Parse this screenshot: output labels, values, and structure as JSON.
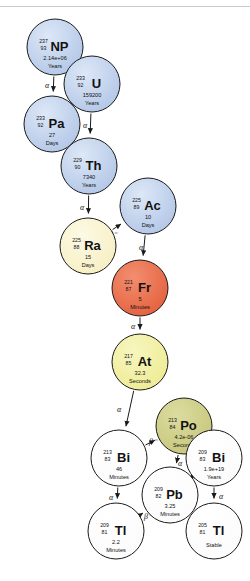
{
  "figure": {
    "caption_truncated": "",
    "colors": {
      "blue": "#b9ccea",
      "cream": "#faf2cd",
      "orange": "#ea6a47",
      "yellow": "#f2f0a2",
      "olive": "#cdcd87",
      "white": "#ffffff",
      "stroke": "#1a1a1a",
      "text": "#111111",
      "divider": "#c9c9d2"
    }
  },
  "nodes": [
    {
      "id": "np237",
      "symbol": "NP",
      "mass": "237",
      "atomic": "93",
      "halflife": "2.14e+06",
      "unit": "Years",
      "fill": "blue",
      "cx": 55,
      "cy": 47,
      "r": 28
    },
    {
      "id": "u233",
      "symbol": "U",
      "mass": "233",
      "atomic": "92",
      "halflife": "159200",
      "unit": "Years",
      "fill": "blue",
      "cx": 92,
      "cy": 84,
      "r": 28
    },
    {
      "id": "pa233",
      "symbol": "Pa",
      "mass": "233",
      "atomic": "92",
      "halflife": "27",
      "unit": "Days",
      "fill": "blue",
      "cx": 52,
      "cy": 124,
      "r": 28
    },
    {
      "id": "th229",
      "symbol": "Th",
      "mass": "229",
      "atomic": "90",
      "halflife": "7340",
      "unit": "Years",
      "fill": "blue",
      "cx": 89,
      "cy": 166,
      "r": 28
    },
    {
      "id": "ac225",
      "symbol": "Ac",
      "mass": "225",
      "atomic": "89",
      "halflife": "10",
      "unit": "Days",
      "fill": "blue",
      "cx": 148,
      "cy": 206,
      "r": 28
    },
    {
      "id": "ra225",
      "symbol": "Ra",
      "mass": "225",
      "atomic": "88",
      "halflife": "15",
      "unit": "Days",
      "fill": "cream",
      "cx": 88,
      "cy": 246,
      "r": 28
    },
    {
      "id": "fr221",
      "symbol": "Fr",
      "mass": "221",
      "atomic": "87",
      "halflife": "5",
      "unit": "Minutes",
      "fill": "orange",
      "cx": 140,
      "cy": 288,
      "r": 28
    },
    {
      "id": "at217",
      "symbol": "At",
      "mass": "217",
      "atomic": "85",
      "halflife": "32.3",
      "unit": "Seconds",
      "fill": "yellow",
      "cx": 140,
      "cy": 362,
      "r": 28
    },
    {
      "id": "po213",
      "symbol": "Po",
      "mass": "213",
      "atomic": "84",
      "halflife": "4.2e-06",
      "unit": "Seconds",
      "fill": "olive",
      "cx": 184,
      "cy": 426,
      "r": 28
    },
    {
      "id": "bi213",
      "symbol": "Bi",
      "mass": "213",
      "atomic": "83",
      "halflife": "46",
      "unit": "Minutes",
      "fill": "white",
      "cx": 119,
      "cy": 458,
      "r": 28
    },
    {
      "id": "bi209",
      "symbol": "Bi",
      "mass": "209",
      "atomic": "83",
      "halflife": "1.9e+19",
      "unit": "Years",
      "fill": "white",
      "cx": 214,
      "cy": 458,
      "r": 28
    },
    {
      "id": "pb209",
      "symbol": "Pb",
      "mass": "209",
      "atomic": "82",
      "halflife": "3.25",
      "unit": "Minutes",
      "fill": "white",
      "cx": 170,
      "cy": 495,
      "r": 28
    },
    {
      "id": "tl209",
      "symbol": "Tl",
      "mass": "209",
      "atomic": "81",
      "halflife": "2.2",
      "unit": "Minutes",
      "fill": "white",
      "cx": 116,
      "cy": 531,
      "r": 28
    },
    {
      "id": "tl205",
      "symbol": "Tl",
      "mass": "205",
      "atomic": "81",
      "halflife": "",
      "unit": "Stable",
      "fill": "white",
      "cx": 214,
      "cy": 531,
      "r": 28
    }
  ],
  "edges": [
    {
      "from": "np237",
      "to": "pa233",
      "label": "α",
      "lx": 47,
      "ly": 88
    },
    {
      "from": "pa233",
      "to": "u233",
      "label": "β⁻",
      "lx": 71,
      "ly": 113
    },
    {
      "from": "u233",
      "to": "th229",
      "label": "α",
      "lx": 85,
      "ly": 128
    },
    {
      "from": "th229",
      "to": "ra225",
      "label": "α",
      "lx": 82,
      "ly": 210
    },
    {
      "from": "ra225",
      "to": "ac225",
      "label": "β⁻",
      "lx": 113,
      "ly": 237
    },
    {
      "from": "ac225",
      "to": "fr221",
      "label": "α",
      "lx": 141,
      "ly": 250
    },
    {
      "from": "fr221",
      "to": "at217",
      "label": "α",
      "lx": 133,
      "ly": 329
    },
    {
      "from": "at217",
      "to": "bi213",
      "label": "α",
      "lx": 119,
      "ly": 412
    },
    {
      "from": "bi213",
      "to": "po213",
      "label": "β⁻",
      "lx": 153,
      "ly": 444
    },
    {
      "from": "bi213",
      "to": "tl209",
      "label": "α",
      "lx": 111,
      "ly": 500
    },
    {
      "from": "po213",
      "to": "pb209",
      "label": "α",
      "lx": 180,
      "ly": 466
    },
    {
      "from": "tl209",
      "to": "pb209",
      "label": "β⁻",
      "lx": 148,
      "ly": 519
    },
    {
      "from": "pb209",
      "to": "bi209",
      "label": "β⁻",
      "lx": 198,
      "ly": 477
    },
    {
      "from": "bi209",
      "to": "tl205",
      "label": "α",
      "lx": 221,
      "ly": 499
    }
  ]
}
